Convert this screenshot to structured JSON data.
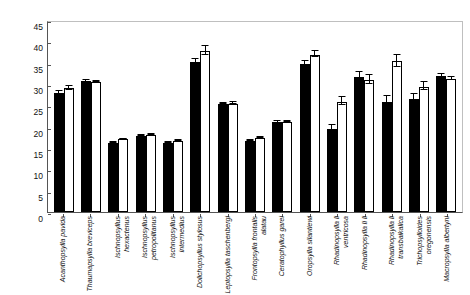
{
  "chart_data": {
    "type": "bar",
    "title": "",
    "xlabel": "",
    "ylabel": "Distance  (µm)",
    "ylim": [
      0,
      45
    ],
    "yticks": [
      0,
      5,
      10,
      15,
      20,
      25,
      30,
      35,
      40,
      45
    ],
    "grid": false,
    "legend": "none",
    "orientation": "vertical",
    "categories": [
      "Acanthopsylla pavida",
      "Thaumapsylla breviceps",
      "Ischnopsyllus hexactenus",
      "Ischnopsyllus petropolitanus",
      "Ischnopsyllus intermedius",
      "Dolichopsyllus stylosus",
      "Leptopsylla taschenbergi",
      "Frontopsylla frontalis alatau",
      "Ceratophyllus garei",
      "Oropsylla silantiewi",
      "Rhadinopsylla li ventricosa",
      "Rhadinopsylla li li",
      "Rhadinopsylla li transbaikalica",
      "Trichopsylloides oregonensis",
      "Macropsylla albertyni"
    ],
    "series": [
      {
        "name": "black",
        "color": "#000000",
        "values": [
          27.9,
          30.6,
          16.2,
          17.8,
          16.1,
          35.2,
          25.3,
          16.6,
          21.0,
          34.6,
          19.4,
          31.6,
          25.7,
          26.6,
          31.9
        ],
        "errors": [
          0.5,
          0.3,
          0.2,
          0.2,
          0.2,
          0.7,
          0.3,
          0.3,
          0.3,
          0.9,
          1.0,
          1.2,
          1.6,
          1.1,
          0.5
        ]
      },
      {
        "name": "white",
        "color": "#ffffff",
        "values": [
          29.0,
          30.5,
          17.0,
          18.0,
          16.6,
          37.7,
          25.4,
          17.3,
          21.1,
          36.9,
          25.9,
          30.9,
          35.3,
          29.4,
          31.2
        ],
        "errors": [
          0.6,
          0.3,
          0.2,
          0.2,
          0.2,
          1.1,
          0.3,
          0.3,
          0.3,
          0.9,
          1.0,
          1.1,
          1.6,
          1.1,
          0.5
        ]
      }
    ]
  }
}
